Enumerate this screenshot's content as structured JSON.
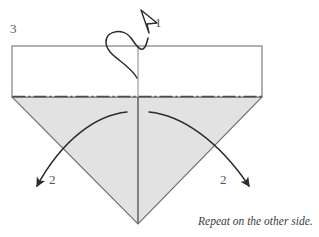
{
  "figure": {
    "type": "origami-instruction-diagram",
    "step_number": "3",
    "caption": "Repeat on the other side.",
    "colors": {
      "paper_front": "#ffffff",
      "paper_back_shaded": "#e2e2e2",
      "outline": "#6f7276",
      "fold_line": "#4a4c50",
      "arrow": "#2b2c2e",
      "label_text": "#55585c",
      "caption_text": "#3b3d40",
      "background": "#ffffff"
    },
    "shapes": {
      "upper_rectangle": {
        "name": "white-flap-rectangle",
        "left": 12,
        "top": 46,
        "right": 262,
        "bottom": 97
      },
      "lower_triangle": {
        "name": "shaded-triangle",
        "apex": [
          138,
          224
        ],
        "left_corner": [
          12,
          97
        ],
        "right_corner": [
          262,
          97
        ]
      },
      "center_vertical_crease": {
        "x": 138,
        "from_y": 46,
        "to_y": 224
      },
      "horizontal_fold_line": {
        "y": 97,
        "from_x": 12,
        "to_x": 262,
        "style": "dash-dot"
      }
    },
    "arrows": [
      {
        "name": "fold-over-loop-arrow",
        "label": "1",
        "label_x": 158,
        "label_y": 22,
        "head_style": "hollow",
        "direction": "up-left",
        "description": "curl-over arrow at top center crossing the horizontal edge"
      },
      {
        "name": "left-fold-down-arrow",
        "label": "2",
        "label_x": 53,
        "label_y": 180,
        "head_style": "solid",
        "direction": "down-left",
        "description": "arc from center crease sweeping down and out to the lower left"
      },
      {
        "name": "right-fold-down-arrow",
        "label": "2",
        "label_x": 224,
        "label_y": 180,
        "head_style": "solid",
        "direction": "down-right",
        "description": "arc from center crease sweeping down and out to the lower right"
      }
    ]
  }
}
